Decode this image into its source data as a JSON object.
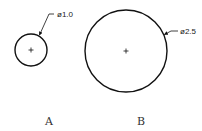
{
  "diagram": {
    "type": "technical-drawing-circles",
    "colors": {
      "line": "#111111",
      "text": "#222222",
      "label": "#333333",
      "background": "#ffffff"
    },
    "circles": [
      {
        "id": "A",
        "label": "A",
        "dimension": "ø1.0",
        "center": [
          31,
          50
        ],
        "radius": 16,
        "leader": {
          "start": [
            39,
            36
          ],
          "elbow": [
            49,
            14
          ],
          "end": [
            54,
            14
          ]
        },
        "dimension_pos": [
          57,
          17
        ],
        "label_pos": [
          49,
          125
        ]
      },
      {
        "id": "B",
        "label": "B",
        "dimension": "ø2.5",
        "center": [
          126,
          51
        ],
        "radius": 41,
        "leader": {
          "start": [
            164,
            35
          ],
          "elbow": [
            171,
            31
          ],
          "end": [
            178,
            31
          ]
        },
        "dimension_pos": [
          180,
          34
        ],
        "label_pos": [
          141,
          125
        ]
      }
    ]
  }
}
